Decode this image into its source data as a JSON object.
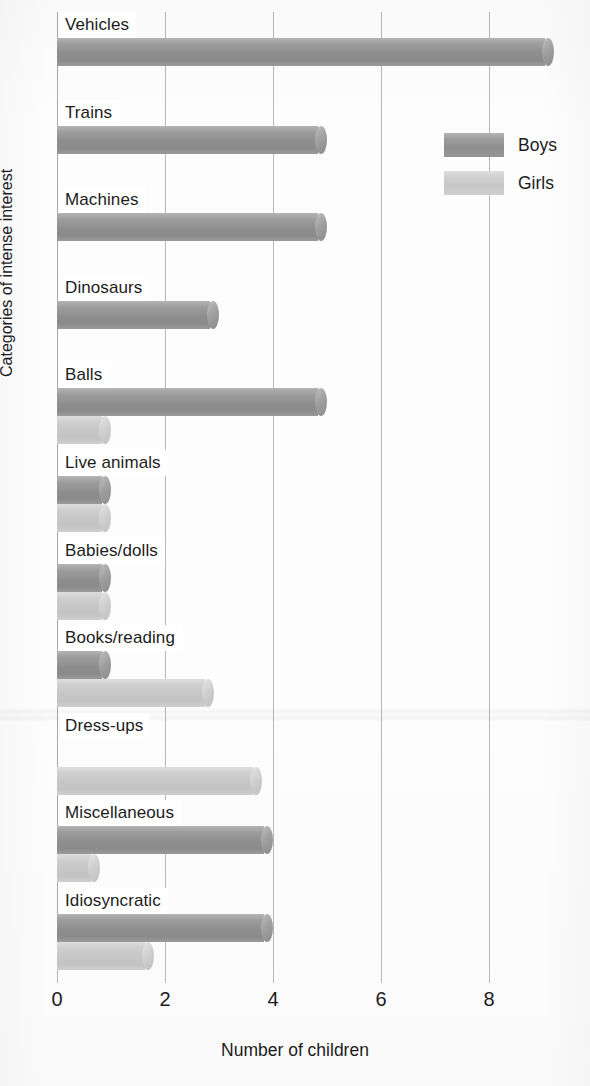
{
  "chart_data": {
    "type": "bar",
    "orientation": "horizontal",
    "title": "",
    "xlabel": "Number of children",
    "ylabel": "Categories of intense interest",
    "xlim": [
      0,
      10
    ],
    "xticks": [
      0,
      2,
      4,
      6,
      8,
      10
    ],
    "xtick_labels": [
      "0",
      "2",
      "4",
      "6",
      "8",
      "1"
    ],
    "grid": "vertical",
    "legend_position": "top-right",
    "categories": [
      "Vehicles",
      "Trains",
      "Machines",
      "Dinosaurs",
      "Balls",
      "Live animals",
      "Babies/dolls",
      "Books/reading",
      "Dress-ups",
      "Miscellaneous",
      "Idiosyncratic"
    ],
    "series": [
      {
        "name": "Boys",
        "color": "#919191",
        "values": [
          9.2,
          5,
          5,
          3,
          5,
          1,
          1,
          1,
          0,
          4,
          4
        ]
      },
      {
        "name": "Girls",
        "color": "#c8c8c8",
        "values": [
          0,
          0,
          0,
          0,
          1,
          1,
          1,
          2.9,
          3.8,
          0.8,
          1.8
        ]
      }
    ]
  },
  "legend": {
    "entries": [
      {
        "label": "Boys"
      },
      {
        "label": "Girls"
      }
    ]
  },
  "axes": {
    "x_title": "Number of children",
    "y_title": "Categories of intense interest"
  }
}
